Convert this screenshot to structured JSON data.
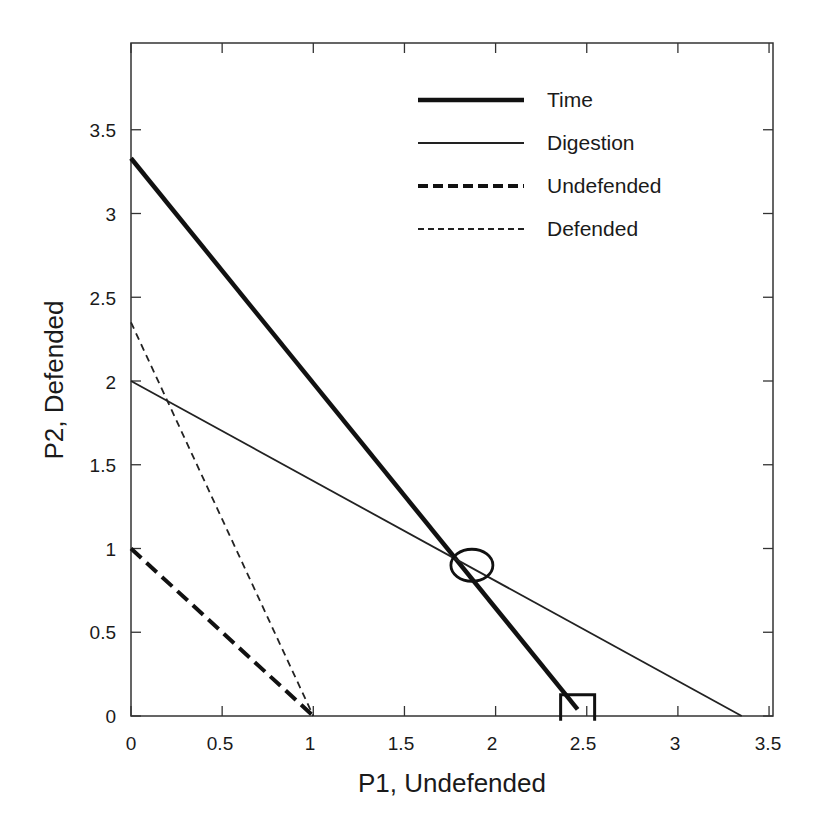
{
  "chart_data": {
    "type": "line",
    "title": "",
    "xlabel": "P1, Undefended",
    "ylabel": "P2, Defended",
    "xlim": [
      0,
      3.5
    ],
    "ylim": [
      0,
      4.0
    ],
    "xticks": [
      "0",
      "0.5",
      "1",
      "1.5",
      "2",
      "2.5",
      "3",
      "3.5"
    ],
    "yticks": [
      "0",
      "0.5",
      "1",
      "1.5",
      "2",
      "2.5",
      "3",
      "3.5"
    ],
    "grid": false,
    "legend_position": "upper right",
    "series": [
      {
        "name": "Time",
        "style": "thick-solid",
        "x": [
          0,
          2.45
        ],
        "y": [
          3.33,
          0.04
        ]
      },
      {
        "name": "Digestion",
        "style": "thin-solid",
        "x": [
          0,
          3.35
        ],
        "y": [
          2.0,
          0
        ]
      },
      {
        "name": "Undefended",
        "style": "thick-dashed",
        "x": [
          0,
          1.0
        ],
        "y": [
          1.0,
          0
        ]
      },
      {
        "name": "Defended",
        "style": "thin-dashed",
        "x": [
          0,
          1.0
        ],
        "y": [
          2.35,
          0
        ]
      }
    ],
    "annotations": [
      {
        "type": "circle",
        "label": "intersection of Time and Digestion",
        "x": 1.87,
        "y": 0.9
      },
      {
        "type": "square",
        "label": "Time x-intercept",
        "x": 2.45,
        "y": 0.02
      }
    ]
  }
}
